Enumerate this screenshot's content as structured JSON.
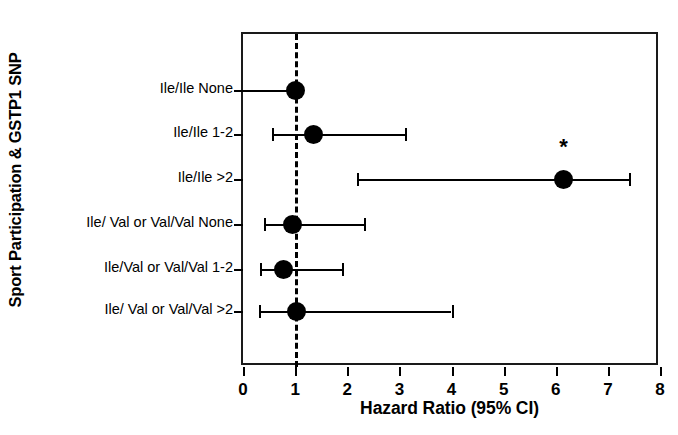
{
  "chart_data": {
    "type": "scatter",
    "subtype": "forest-plot",
    "title": "",
    "xlabel": "Hazard Ratio (95% CI)",
    "ylabel": "Sport Participation & GSTP1 SNP",
    "xlim": [
      0,
      8
    ],
    "ylim": [
      0,
      7
    ],
    "xticks": [
      0,
      1,
      2,
      3,
      4,
      5,
      6,
      7,
      8
    ],
    "xticklabels": [
      "0",
      "1",
      "2",
      "3",
      "4",
      "5",
      "6",
      "7",
      "8"
    ],
    "grid": false,
    "legend": null,
    "reference_line": {
      "value": 1.0,
      "style": "dashed",
      "color": "#000000"
    },
    "categories": [
      "Ile/Ile None",
      "Ile/Ile 1-2",
      "Ile/Ile >2",
      "Ile/ Val or Val/Val None",
      "Ile/Val or Val/Val 1-2",
      "Ile/ Val or Val/Val >2"
    ],
    "points": [
      {
        "label": "Ile/Ile None",
        "hr": 1.0,
        "ci_low": null,
        "ci_high": null,
        "reference": true,
        "significant": false,
        "annotation": ""
      },
      {
        "label": "Ile/Ile 1-2",
        "hr": 1.35,
        "ci_low": 0.55,
        "ci_high": 3.1,
        "reference": false,
        "significant": false,
        "annotation": ""
      },
      {
        "label": "Ile/Ile >2",
        "hr": 6.15,
        "ci_low": 2.18,
        "ci_high": 7.4,
        "reference": false,
        "significant": true,
        "annotation": "*"
      },
      {
        "label": "Ile/ Val or Val/Val None",
        "hr": 0.95,
        "ci_low": 0.4,
        "ci_high": 2.32,
        "reference": false,
        "significant": false,
        "annotation": ""
      },
      {
        "label": "Ile/Val or Val/Val 1-2",
        "hr": 0.78,
        "ci_low": 0.32,
        "ci_high": 1.9,
        "reference": false,
        "significant": false,
        "annotation": ""
      },
      {
        "label": "Ile/ Val or Val/Val >2",
        "hr": 1.03,
        "ci_low": 0.3,
        "ci_high": 4.0,
        "reference": false,
        "significant": false,
        "annotation": ""
      }
    ],
    "annotations": [
      {
        "text": "*",
        "attached_to": "Ile/Ile >2",
        "meaning": "statistically significant"
      }
    ],
    "colors": {
      "marker": "#000000",
      "line": "#000000",
      "axis": "#1a1a1a",
      "background": "#ffffff"
    }
  }
}
